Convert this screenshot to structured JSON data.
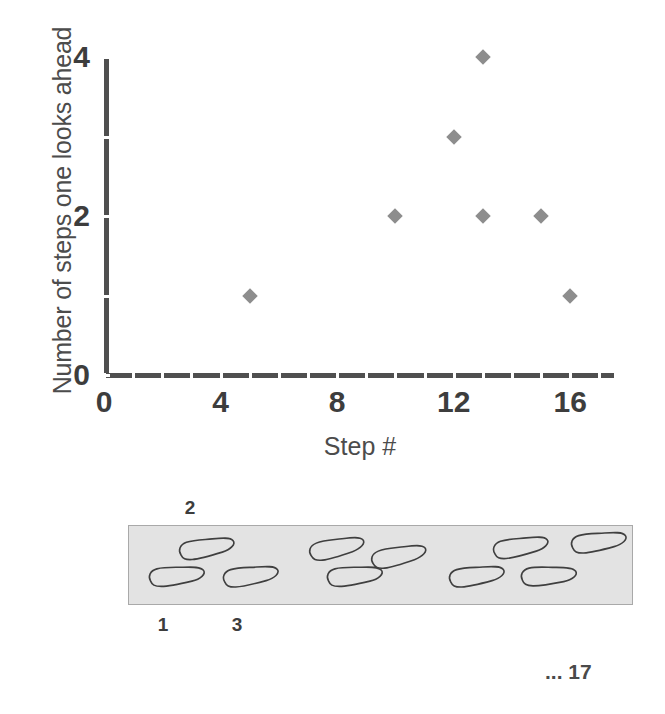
{
  "chart_data": {
    "type": "scatter",
    "title": "",
    "xlabel": "Step #",
    "ylabel": "Number of steps one looks ahead",
    "xlim": [
      0,
      17.5
    ],
    "ylim": [
      0,
      4
    ],
    "xticks": [
      0,
      4,
      8,
      12,
      16
    ],
    "xtick_labels": [
      "0",
      "4",
      "8",
      "12",
      "16"
    ],
    "yticks": [
      0,
      2,
      4
    ],
    "ytick_labels": [
      "0",
      "2",
      "4"
    ],
    "yminor_ticks": [
      1,
      3
    ],
    "grid": false,
    "legend": null,
    "marker": "diamond",
    "marker_color": "#8d8d8d",
    "points": [
      {
        "x": 5,
        "y": 1
      },
      {
        "x": 10,
        "y": 2
      },
      {
        "x": 12,
        "y": 3
      },
      {
        "x": 13,
        "y": 4
      },
      {
        "x": 13,
        "y": 2
      },
      {
        "x": 15,
        "y": 2
      },
      {
        "x": 16,
        "y": 1
      }
    ]
  },
  "footprint_diagram": {
    "walkway_color": "#e3e3e3",
    "walkway_border_color": "#a9a9a9",
    "labels_above": [
      {
        "text": "2",
        "x": 190
      }
    ],
    "labels_below": [
      {
        "text": "1",
        "x": 163
      },
      {
        "text": "3",
        "x": 237
      }
    ],
    "continuation_label": "... 17",
    "footprints": [
      {
        "id": "step-1",
        "left": 18,
        "top": 38,
        "angle": -8,
        "flip": false
      },
      {
        "id": "step-2",
        "left": 48,
        "top": 10,
        "angle": -12,
        "flip": false
      },
      {
        "id": "step-3",
        "left": 92,
        "top": 38,
        "angle": -10,
        "flip": false
      },
      {
        "id": "step-4",
        "left": 178,
        "top": 10,
        "angle": -14,
        "flip": false
      },
      {
        "id": "step-5",
        "left": 196,
        "top": 38,
        "angle": -8,
        "flip": false
      },
      {
        "id": "step-6",
        "left": 240,
        "top": 18,
        "angle": -14,
        "flip": false
      },
      {
        "id": "step-7",
        "left": 318,
        "top": 38,
        "angle": -10,
        "flip": false
      },
      {
        "id": "step-8",
        "left": 362,
        "top": 9,
        "angle": -12,
        "flip": false
      },
      {
        "id": "step-9",
        "left": 390,
        "top": 38,
        "angle": -6,
        "flip": false
      },
      {
        "id": "step-10",
        "left": 440,
        "top": 4,
        "angle": -10,
        "flip": false
      }
    ]
  }
}
